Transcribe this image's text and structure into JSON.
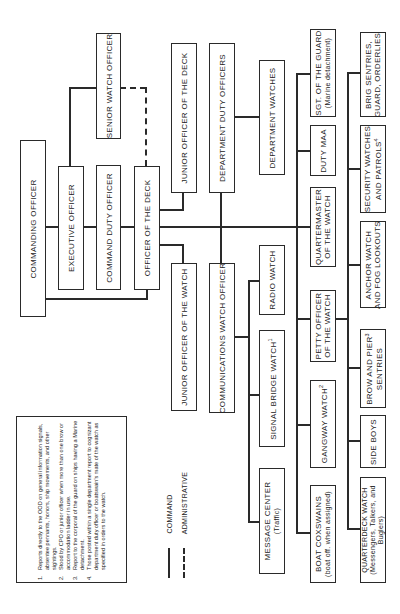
{
  "chart": {
    "orientation": "rotated -90deg (text reads bottom-to-top)",
    "nodes": {
      "commanding_officer": "COMMANDING OFFICER",
      "executive_officer": "EXECUTIVE OFFICER",
      "command_duty_officer": "COMMAND DUTY OFFICER",
      "officer_of_the_deck": "OFFICER OF THE DECK",
      "senior_watch_officer": "SENIOR WATCH OFFICER",
      "junior_officer_of_the_deck": "JUNIOR OFFICER OF THE DECK",
      "junior_officer_of_the_watch": "JUNIOR OFFICER OF THE WATCH",
      "department_duty_officers": "DEPARTMENT DUTY OFFICERS",
      "communications_watch_officer": "COMMUNICATIONS WATCH OFFICER",
      "department_watches": "DEPARTMENT WATCHES",
      "radio_watch": "RADIO WATCH",
      "signal_bridge_watch": "SIGNAL BRIDGE WATCH",
      "signal_bridge_watch_note": "1",
      "message_center": "MESSAGE CENTER",
      "message_center_sub": "(Traffic)",
      "sgt_of_the_guard": "SGT. OF THE GUARD",
      "sgt_of_the_guard_sub": "(Marine detachment)",
      "duty_maa": "DUTY MAA",
      "quartermaster_l1": "QUARTERMASTER",
      "quartermaster_l2": "OF THE WATCH",
      "poow_l1": "PETTY OFFICER",
      "poow_l2": "OF THE WATCH",
      "gangway_watch": "GANGWAY WATCH",
      "gangway_watch_note": "2",
      "boat_coxswains": "BOAT COXSWAINS",
      "boat_coxswains_sub": "(boat off. when assigned)",
      "brig_l1": "BRIG SENTRIES,",
      "brig_l2": "GUARD, ORDERLIES",
      "security_l1": "SECURITY WATCHES",
      "security_l2": "AND PATROLS",
      "security_note": "4",
      "anchor_l1": "ANCHOR WATCH",
      "anchor_l2": "AND FOG LOOKOUTS",
      "brow_l1": "BROW AND PIER",
      "brow_note": "3",
      "brow_l2": "SENTRIES",
      "side_boys": "SIDE BOYS",
      "quarterdeck_l1": "QUARTERDECK WATCH",
      "quarterdeck_l2": "(Messengers, Talkers, and",
      "quarterdeck_l3": "Buglers)"
    },
    "legend": {
      "command": "COMMAND",
      "administrative": "ADMINISTRATIVE"
    },
    "notes": [
      {
        "num": "1.",
        "text": "Reports directly to the OOD on general information signals, absentee pennants, honors, ship movements, and other sightings."
      },
      {
        "num": "2.",
        "text": "Stood by CPO or junior officer when more than one brow or accommodation ladder in use."
      },
      {
        "num": "3.",
        "text": "Report to the corporal of the guard on ships having a Marine detachment."
      },
      {
        "num": "4.",
        "text": "Those posted within a single department report to cognizant department duty officer or boatswain's mate of the watch as specified in orders to the watch."
      }
    ],
    "colors": {
      "line": "#2a2a2a",
      "background": "#ffffff"
    }
  }
}
